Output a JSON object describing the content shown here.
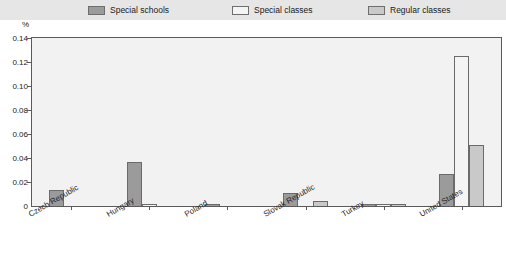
{
  "legend": {
    "items": [
      {
        "label": "Special schools",
        "color": "#9b9b9b"
      },
      {
        "label": "Special classes",
        "color": "#f4f4f4"
      },
      {
        "label": "Regular classes",
        "color": "#c9c9c9"
      }
    ]
  },
  "axis": {
    "unit": "%",
    "yticks": [
      "0.14",
      "0.12",
      "0.10",
      "0.08",
      "0.06",
      "0.04",
      "0.02",
      "0"
    ]
  },
  "chart_data": {
    "type": "bar",
    "title": "",
    "xlabel": "",
    "ylabel": "%",
    "ylim": [
      0,
      0.14
    ],
    "ytick_values": [
      0,
      0.02,
      0.04,
      0.06,
      0.08,
      0.1,
      0.12,
      0.14
    ],
    "grid": false,
    "legend_position": "top",
    "categories": [
      "Czech Republic",
      "Hungary",
      "Poland",
      "Slovak Republic",
      "Turkey",
      "United States"
    ],
    "series": [
      {
        "name": "Special schools",
        "color": "#9b9b9b",
        "values": [
          0.013,
          0.037,
          0.002,
          0.011,
          0.0008,
          0.027
        ]
      },
      {
        "name": "Special classes",
        "color": "#f4f4f4",
        "values": [
          0.0,
          0.002,
          0.0,
          0.0,
          0.0006,
          0.125
        ]
      },
      {
        "name": "Regular classes",
        "color": "#c9c9c9",
        "values": [
          0.0,
          0.0,
          0.0,
          0.004,
          0.0006,
          0.051
        ]
      }
    ]
  }
}
